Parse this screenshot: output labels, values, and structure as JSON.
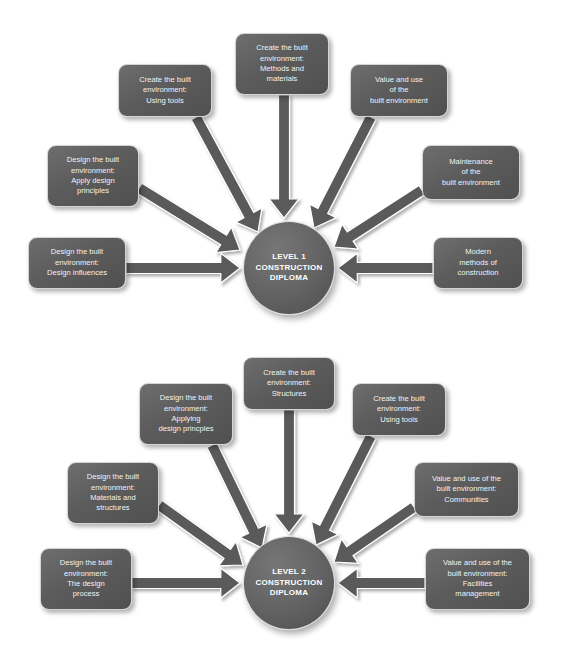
{
  "theme": {
    "background": "#ffffff",
    "node_fill": "#5c5c5c",
    "node_border": "#d4d4d4",
    "node_text": "#f2f2f2",
    "hub_fill": "#646464",
    "arrow_color": "#5a5a5a"
  },
  "diagrams": [
    {
      "id": "level-1-construction-diploma",
      "hub": {
        "label_lines": [
          "LEVEL 1",
          "CONSTRUCTION",
          "DIPLOMA"
        ],
        "cx": 289,
        "cy": 268,
        "rx": 46,
        "ry": 47
      },
      "nodes": [
        {
          "id": "l1-create-using-tools",
          "label_lines": [
            "Create the built",
            "environment:",
            "Using tools"
          ],
          "x": 118,
          "y": 64,
          "w": 94,
          "h": 53,
          "arrow": {
            "x1": 196,
            "y1": 117,
            "x2": 258,
            "y2": 232,
            "width": 11
          }
        },
        {
          "id": "l1-create-methods-materials",
          "label_lines": [
            "Create the built",
            "environment:",
            "Methods and",
            "materials"
          ],
          "x": 235,
          "y": 33,
          "w": 94,
          "h": 62,
          "arrow": {
            "x1": 284,
            "y1": 95,
            "x2": 284,
            "y2": 218,
            "width": 11
          }
        },
        {
          "id": "l1-value-and-use",
          "label_lines": [
            "Value and use",
            "of the",
            "built environment"
          ],
          "x": 350,
          "y": 64,
          "w": 98,
          "h": 53,
          "arrow": {
            "x1": 371,
            "y1": 117,
            "x2": 314,
            "y2": 228,
            "width": 11
          }
        },
        {
          "id": "l1-design-apply-principles",
          "label_lines": [
            "Design the built",
            "environment:",
            "Apply design",
            "principles"
          ],
          "x": 47,
          "y": 145,
          "w": 92,
          "h": 62,
          "arrow": {
            "x1": 139,
            "y1": 188,
            "x2": 240,
            "y2": 250,
            "width": 11
          }
        },
        {
          "id": "l1-maintenance",
          "label_lines": [
            "Maintenance",
            "of the",
            "built environment"
          ],
          "x": 422,
          "y": 145,
          "w": 98,
          "h": 55,
          "arrow": {
            "x1": 422,
            "y1": 190,
            "x2": 334,
            "y2": 247,
            "width": 11
          }
        },
        {
          "id": "l1-design-influences",
          "label_lines": [
            "Design the built",
            "environment:",
            "Design influences"
          ],
          "x": 28,
          "y": 237,
          "w": 98,
          "h": 52,
          "arrow": {
            "x1": 126,
            "y1": 268,
            "x2": 240,
            "y2": 268,
            "width": 11
          }
        },
        {
          "id": "l1-modern-methods",
          "label_lines": [
            "Modern",
            "methods of",
            "construction"
          ],
          "x": 433,
          "y": 237,
          "w": 90,
          "h": 52,
          "arrow": {
            "x1": 433,
            "y1": 268,
            "x2": 338,
            "y2": 268,
            "width": 11
          }
        }
      ]
    },
    {
      "id": "level-2-construction-diploma",
      "hub": {
        "label_lines": [
          "LEVEL 2",
          "CONSTRUCTION",
          "DIPLOMA"
        ],
        "cx": 289,
        "cy": 253,
        "rx": 46,
        "ry": 47
      },
      "nodes": [
        {
          "id": "l2-design-applying-principles",
          "label_lines": [
            "Design the built",
            "environment:",
            "Applying",
            "design princples"
          ],
          "x": 139,
          "y": 53,
          "w": 94,
          "h": 62,
          "arrow": {
            "x1": 212,
            "y1": 115,
            "x2": 262,
            "y2": 218,
            "width": 11
          }
        },
        {
          "id": "l2-create-structures",
          "label_lines": [
            "Create the built",
            "environment:",
            "Structures"
          ],
          "x": 243,
          "y": 27,
          "w": 92,
          "h": 53,
          "arrow": {
            "x1": 289,
            "y1": 80,
            "x2": 289,
            "y2": 203,
            "width": 11
          }
        },
        {
          "id": "l2-create-using-tools",
          "label_lines": [
            "Create the built",
            "environment:",
            "Using tools"
          ],
          "x": 352,
          "y": 53,
          "w": 94,
          "h": 53,
          "arrow": {
            "x1": 371,
            "y1": 106,
            "x2": 316,
            "y2": 215,
            "width": 11
          }
        },
        {
          "id": "l2-design-materials-structures",
          "label_lines": [
            "Design the built",
            "environment:",
            "Materials and",
            "structures"
          ],
          "x": 67,
          "y": 132,
          "w": 92,
          "h": 62,
          "arrow": {
            "x1": 159,
            "y1": 175,
            "x2": 243,
            "y2": 235,
            "width": 11
          }
        },
        {
          "id": "l2-value-communities",
          "label_lines": [
            "Value and use of the",
            "built environment:",
            "Communities"
          ],
          "x": 414,
          "y": 132,
          "w": 105,
          "h": 55,
          "arrow": {
            "x1": 414,
            "y1": 177,
            "x2": 334,
            "y2": 232,
            "width": 11
          }
        },
        {
          "id": "l2-design-process",
          "label_lines": [
            "Design the built",
            "environment:",
            "The design",
            "process"
          ],
          "x": 40,
          "y": 218,
          "w": 92,
          "h": 62,
          "arrow": {
            "x1": 132,
            "y1": 253,
            "x2": 240,
            "y2": 253,
            "width": 11
          }
        },
        {
          "id": "l2-value-facilities",
          "label_lines": [
            "Value and use of the",
            "built environment:",
            "Facilities",
            "management"
          ],
          "x": 425,
          "y": 218,
          "w": 105,
          "h": 62,
          "arrow": {
            "x1": 425,
            "y1": 253,
            "x2": 338,
            "y2": 253,
            "width": 11
          }
        }
      ]
    }
  ]
}
